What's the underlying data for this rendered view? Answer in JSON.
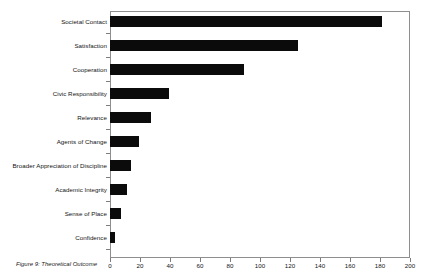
{
  "caption": "Figure 9: Theoretical Outcome",
  "chart_data": {
    "type": "bar",
    "orientation": "horizontal",
    "title": "",
    "xlabel": "",
    "ylabel": "",
    "xlim": [
      0,
      200
    ],
    "xticks": [
      0,
      20,
      40,
      60,
      80,
      100,
      120,
      140,
      160,
      180,
      200
    ],
    "xtick_labels": [
      "0",
      "20",
      "40",
      "60",
      "80",
      "100",
      "120",
      "140",
      "160",
      "180",
      "200"
    ],
    "grid": false,
    "legend": null,
    "bar_color": "#0b0b0b",
    "categories": [
      "Societal Contact",
      "Satisfaction",
      "Cooperation",
      "Civic Responsibility",
      "Relevance",
      "Agents of Change",
      "Broader Appreciation of Discipline",
      "Academic Integrity",
      "Sense of Place",
      "Confidence"
    ],
    "values": [
      181,
      125,
      89,
      39,
      27,
      19,
      14,
      11,
      7,
      3
    ]
  }
}
